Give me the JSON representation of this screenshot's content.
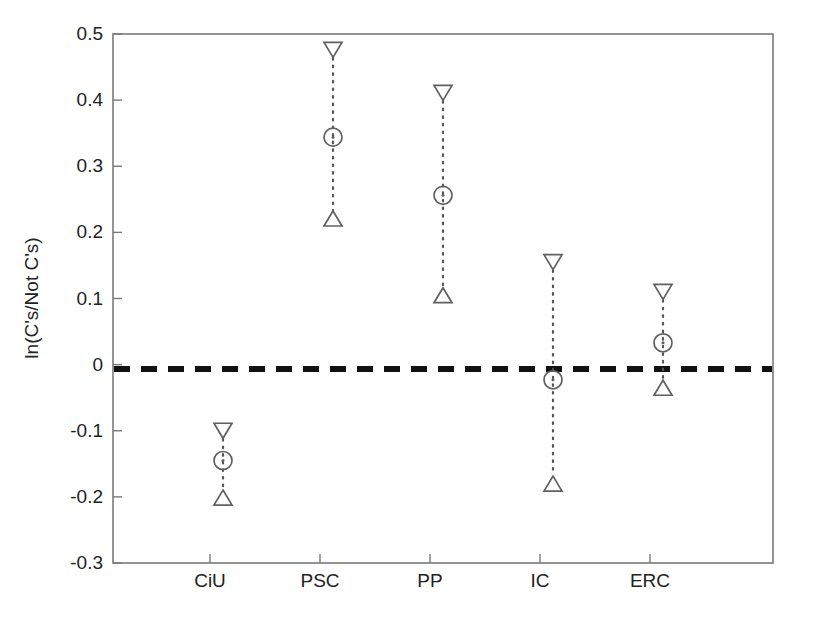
{
  "chart_data": {
    "type": "scatter",
    "title": "",
    "subtitle": "",
    "xlabel": "",
    "ylabel": "ln(C's/Not C's)",
    "categories": [
      "CiU",
      "PSC",
      "PP",
      "IC",
      "ERC"
    ],
    "ylim": [
      -0.3,
      0.5
    ],
    "xlim": [
      0,
      6
    ],
    "ytick_labels": [
      "0.5",
      "0.4",
      "0.3",
      "0.2",
      "0.1",
      "0",
      "-0.1",
      "-0.2",
      "-0.3"
    ],
    "ytick_values": [
      0.5,
      0.4,
      0.3,
      0.2,
      0.1,
      0,
      -0.1,
      -0.2,
      -0.3
    ],
    "grid": false,
    "legend": "none",
    "reference_line": {
      "value": 0,
      "style": "dashed",
      "color": "#111111",
      "label": "zero reference"
    },
    "series": [
      {
        "name": "Upper bound",
        "marker": "down-triangle",
        "values": [
          -0.1,
          0.476,
          0.411,
          0.155,
          0.11
        ]
      },
      {
        "name": "Point estimate",
        "marker": "circle",
        "values": [
          -0.145,
          0.344,
          0.256,
          -0.023,
          0.033
        ]
      },
      {
        "name": "Lower bound",
        "marker": "up-triangle",
        "values": [
          -0.201,
          0.221,
          0.105,
          -0.18,
          -0.035
        ]
      }
    ],
    "points": [
      {
        "category": "CiU",
        "upper": -0.1,
        "estimate": -0.145,
        "lower": -0.201
      },
      {
        "category": "PSC",
        "upper": 0.476,
        "estimate": 0.344,
        "lower": 0.221
      },
      {
        "category": "PP",
        "upper": 0.411,
        "estimate": 0.256,
        "lower": 0.105
      },
      {
        "category": "IC",
        "upper": 0.155,
        "estimate": -0.023,
        "lower": -0.18
      },
      {
        "category": "ERC",
        "upper": 0.11,
        "estimate": 0.033,
        "lower": -0.035
      }
    ]
  },
  "colors": {
    "background": "#ffffff",
    "axis": "#7a7a7a",
    "marker": "#606060",
    "zero_line": "#111111",
    "text": "#222222"
  }
}
